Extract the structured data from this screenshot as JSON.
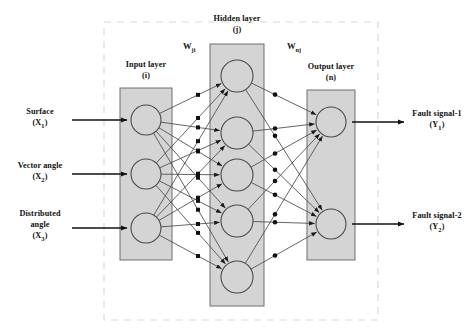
{
  "figure": {
    "type": "neural-network-architecture",
    "frame": {
      "style": "dashed",
      "color": "#d9d9d9"
    },
    "palette": {
      "box_fill": "#d4d4d4",
      "box_stroke": "#6e6e6e",
      "node_fill": "#d4d4d4",
      "node_stroke": "#4a4a4a",
      "edge": "#4a4a4a",
      "arrow": "#111111",
      "text": "#111111"
    }
  },
  "layers": {
    "input": {
      "title": "Input layer",
      "index": "(i)",
      "node_count": 3,
      "inputs": [
        {
          "label": "Surface",
          "symbol": "X",
          "subscript": "1"
        },
        {
          "label": "Vector angle",
          "symbol": "X",
          "subscript": "2"
        },
        {
          "label": "Distributed angle",
          "symbol": "X",
          "subscript": "3"
        }
      ]
    },
    "hidden": {
      "title": "Hidden layer",
      "index": "(j)",
      "node_count": 5
    },
    "output": {
      "title": "Output layer",
      "index": "(n)",
      "node_count": 2,
      "outputs": [
        {
          "label": "Fault signal-1",
          "symbol": "Y",
          "subscript": "1"
        },
        {
          "label": "Fault signal-2",
          "symbol": "Y",
          "subscript": "2"
        }
      ]
    }
  },
  "weights": {
    "input_to_hidden": {
      "symbol": "W",
      "subscript": "ji"
    },
    "hidden_to_output": {
      "symbol": "W",
      "subscript": "nj"
    }
  },
  "geometry": {
    "frame": {
      "x": 104,
      "y": 22,
      "w": 274,
      "h": 298
    },
    "input_box": {
      "x": 120,
      "y": 88,
      "w": 52,
      "h": 172
    },
    "hidden_box": {
      "x": 210,
      "y": 44,
      "w": 54,
      "h": 262
    },
    "output_box": {
      "x": 307,
      "y": 90,
      "w": 48,
      "h": 170
    },
    "node_r": 15,
    "hidden_node_r": 16,
    "input_nodes_y": [
      120,
      174,
      228
    ],
    "hidden_nodes_y": [
      76,
      133,
      175,
      221,
      277
    ],
    "output_nodes_y": [
      122,
      224
    ],
    "input_x": 146,
    "hidden_x": 237,
    "output_x": 331,
    "in_arrow": {
      "x1": 72,
      "x2": 127
    },
    "out_arrow": {
      "x1": 352,
      "x2": 404
    }
  }
}
